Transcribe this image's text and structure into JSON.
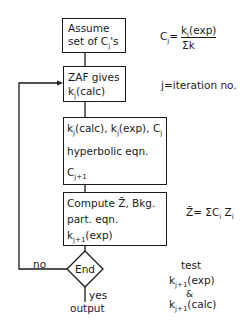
{
  "flowchart": {
    "box1": {
      "line1": "Assume",
      "line2_pre": "set of C",
      "line2_sub": "j",
      "line2_post": "'s"
    },
    "box2": {
      "line1": "ZAF gives",
      "line2_pre": "k",
      "line2_sub": "j",
      "line2_post": "(calc)"
    },
    "box3": {
      "line1_a": "k",
      "line1_a_sub": "j",
      "line1_b": "(calc), k",
      "line1_b_sub": "j",
      "line1_c": "(exp), C",
      "line1_c_sub": "j",
      "line2": "hyperbolic eqn.",
      "line3_pre": "C",
      "line3_sub": "j+1"
    },
    "box4": {
      "line1": "Compute Z̄, Bkg.",
      "line2": "part. eqn.",
      "line3_pre": "k",
      "line3_sub": "j+1",
      "line3_post": "(exp)"
    },
    "decision": {
      "label": "End",
      "no_label": "no",
      "yes_label": "yes",
      "output_label": "output"
    }
  },
  "annotations": {
    "cj_formula": {
      "lhs_pre": "C",
      "lhs_sub": "j",
      "eq": "=",
      "numerator_pre": "k",
      "numerator_sub": "i",
      "numerator_post": "(exp)",
      "denominator": "Σk"
    },
    "iteration_note": "j=iteration no.",
    "z_formula": {
      "lhs": "Z̄",
      "rhs_pre": "= ΣC",
      "rhs_sub1": "i",
      "rhs_mid": " Z",
      "rhs_sub2": "i"
    },
    "test_note": {
      "line1": "test",
      "line2_pre": "k",
      "line2_sub": "j+1",
      "line2_post": "(exp)",
      "amp": "&",
      "line3_pre": "k",
      "line3_sub": "j+1",
      "line3_post": "(calc)"
    }
  },
  "colors": {
    "ink": "#1a1a1a",
    "background": "#ffffff"
  }
}
